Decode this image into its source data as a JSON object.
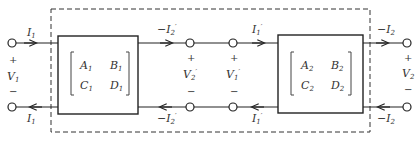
{
  "diagram": {
    "type": "cascaded two-port networks (ABCD)",
    "colors": {
      "stroke": "#222222",
      "text": "#333333"
    },
    "network1": {
      "matrix": {
        "a": "A",
        "a_sub": "1",
        "b": "B",
        "b_sub": "1",
        "c": "C",
        "c_sub": "1",
        "d": "D",
        "d_sub": "1"
      }
    },
    "network2": {
      "matrix": {
        "a": "A",
        "a_sub": "2",
        "b": "B",
        "b_sub": "2",
        "c": "C",
        "c_sub": "2",
        "d": "D",
        "d_sub": "2"
      }
    },
    "labels": {
      "i1_top": "I",
      "i1_sub": "1",
      "i1_bottom": "I",
      "v1": "V",
      "v1_sub": "1",
      "neg_i2p_top": "−I",
      "i2p_sub": "2",
      "prime": "′",
      "neg_i2p_bottom": "−I",
      "v2p": "V",
      "v2p_sub": "2",
      "v1p": "V",
      "v1p_sub": "1",
      "i1p_top": "I",
      "i1p_sub": "1",
      "i1p_bottom": "I",
      "neg_i2_top": "−I",
      "i2_sub": "2",
      "neg_i2_bottom": "−I",
      "v2": "V",
      "v2_sub": "2",
      "plus": "+",
      "minus": "−"
    }
  }
}
